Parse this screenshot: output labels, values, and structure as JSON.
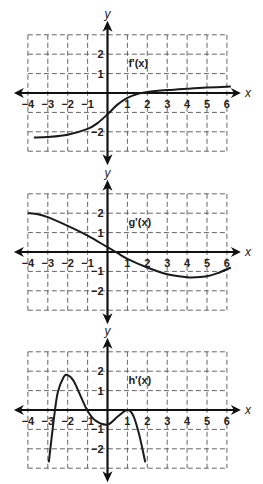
{
  "chart_data": [
    {
      "type": "line",
      "title": "f'(x)",
      "function_label": "f'(x)",
      "xlabel": "x",
      "ylabel": "y",
      "xlim": [
        -4,
        6
      ],
      "ylim": [
        -3,
        3
      ],
      "x_ticks": [
        "−4",
        "−3",
        "−2",
        "−1",
        "1",
        "2",
        "3",
        "4",
        "5",
        "6"
      ],
      "y_ticks": [
        "2",
        "1",
        "−2"
      ],
      "grid": true,
      "x": [
        -3.7,
        -3,
        -2,
        -1,
        -0.5,
        0,
        0.5,
        1,
        1.5,
        2,
        3,
        4,
        5,
        6.2
      ],
      "values": [
        -2.3,
        -2.27,
        -2.15,
        -1.85,
        -1.55,
        -1.1,
        -0.6,
        -0.25,
        -0.05,
        0.05,
        0.15,
        0.22,
        0.28,
        0.33
      ]
    },
    {
      "type": "line",
      "title": "g'(x)",
      "function_label": "g'(x)",
      "xlabel": "x",
      "ylabel": "y",
      "xlim": [
        -4,
        6
      ],
      "ylim": [
        -3,
        3
      ],
      "x_ticks": [
        "−4",
        "−3",
        "−2",
        "−1",
        "1",
        "2",
        "3",
        "4",
        "5",
        "6"
      ],
      "y_ticks": [
        "2",
        "1",
        "−1",
        "−2"
      ],
      "grid": true,
      "x": [
        -4,
        -3.5,
        -3,
        -2,
        -1,
        0,
        0.5,
        1,
        2,
        3,
        4,
        4.5,
        5,
        5.5,
        6.2
      ],
      "values": [
        2.0,
        1.95,
        1.8,
        1.35,
        0.85,
        0.25,
        -0.05,
        -0.35,
        -0.8,
        -1.15,
        -1.3,
        -1.3,
        -1.25,
        -1.1,
        -0.8
      ]
    },
    {
      "type": "line",
      "title": "h'(x)",
      "function_label": "h'(x)",
      "xlabel": "x",
      "ylabel": "y",
      "xlim": [
        -4,
        6
      ],
      "ylim": [
        -3,
        3
      ],
      "x_ticks": [
        "−4",
        "−3",
        "−2",
        "−1",
        "1",
        "2",
        "3",
        "4",
        "5",
        "6"
      ],
      "y_ticks": [
        "2",
        "1",
        "−1",
        "−2"
      ],
      "grid": true,
      "x": [
        -2.95,
        -2.7,
        -2.5,
        -2.2,
        -2.0,
        -1.7,
        -1.3,
        -1.0,
        -0.6,
        0,
        0.5,
        1.0,
        1.3,
        1.6,
        1.9
      ],
      "values": [
        -2.7,
        -0.5,
        0.9,
        1.7,
        1.8,
        1.5,
        0.6,
        -0.05,
        -0.55,
        -0.75,
        -0.35,
        0.0,
        -0.3,
        -1.3,
        -2.7
      ]
    }
  ]
}
